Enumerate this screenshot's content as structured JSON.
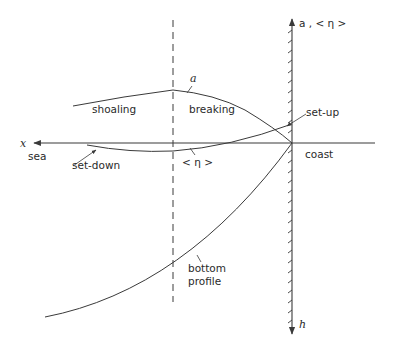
{
  "diagram": {
    "axes": {
      "x_label": "x",
      "vertical_top_label": "a , < η >",
      "vertical_bottom_label": "h"
    },
    "regions": {
      "sea": "sea",
      "coast": "coast"
    },
    "curve_labels": {
      "wave_amplitude": "a",
      "mean_level": "< η >",
      "bottom": [
        "bottom",
        "profile"
      ]
    },
    "zone_labels": {
      "shoaling": "shoaling",
      "breaking": "breaking"
    },
    "annotations": {
      "set_down": "set-down",
      "set_up": "set-up"
    },
    "colors": {
      "line": "#3a3a3a",
      "text": "#2a2a2a",
      "background": "#ffffff"
    }
  }
}
